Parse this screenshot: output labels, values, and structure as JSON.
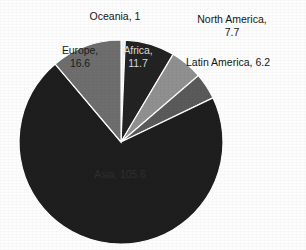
{
  "chart_data": {
    "type": "pie",
    "title": "",
    "subtitle": "",
    "xlabel": "",
    "ylabel": "",
    "legend_position": "none",
    "grid": false,
    "labels_shown_as": "category, value",
    "total": 148.8,
    "categories": [
      "Oceania",
      "Africa",
      "North America",
      "Latin America",
      "Asia",
      "Europe"
    ],
    "values": [
      1,
      11.7,
      7.7,
      6.2,
      105.6,
      16.6
    ],
    "slices": [
      {
        "name": "Oceania",
        "label": "Oceania, 1",
        "value": 1,
        "color": "#f2f2f2",
        "label_placement": "outside-top",
        "label_lines": [
          "Oceania, 1"
        ]
      },
      {
        "name": "Africa",
        "label": "Africa, 11.7",
        "value": 11.7,
        "color": "#232323",
        "label_placement": "inside",
        "label_lines": [
          "Africa,",
          "11.7"
        ]
      },
      {
        "name": "North America",
        "label": "North America, 7.7",
        "value": 7.7,
        "color": "#909090",
        "label_placement": "outside-right",
        "label_lines": [
          "North America,",
          "7.7"
        ]
      },
      {
        "name": "Latin America",
        "label": "Latin America, 6.2",
        "value": 6.2,
        "color": "#5a5a5a",
        "label_placement": "outside-right",
        "label_lines": [
          "Latin America, 6.2"
        ]
      },
      {
        "name": "Asia",
        "label": "Asia, 105.6",
        "value": 105.6,
        "color": "#1e1e1e",
        "label_placement": "inside",
        "label_lines": [
          "Asia, 105.6"
        ]
      },
      {
        "name": "Europe",
        "label": "Europe, 16.6",
        "value": 16.6,
        "color": "#6e6e6e",
        "label_placement": "inside",
        "label_lines": [
          "Europe,",
          "16.6"
        ]
      }
    ],
    "geometry": {
      "center_x": 121,
      "center_y": 142,
      "radius": 102,
      "start_angle_deg": -90,
      "direction": "clockwise"
    },
    "colors": {
      "background": "#fdfdfd",
      "slice_border": "#ffffff",
      "label_dark": "#1b1b1b",
      "label_light": "#d8d8d8"
    }
  }
}
